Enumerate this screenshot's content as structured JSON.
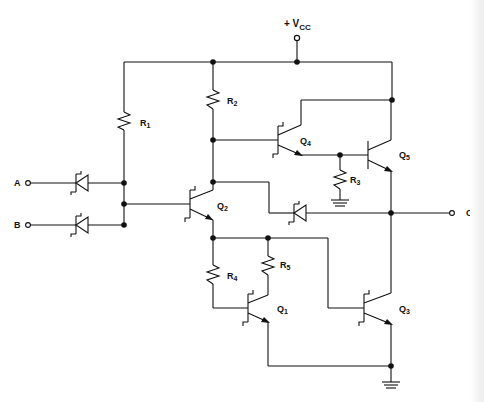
{
  "diagram": {
    "type": "circuit-schematic",
    "supply_label": "+ V",
    "supply_sub": "CC",
    "inputs": [
      {
        "label": "A"
      },
      {
        "label": "B"
      }
    ],
    "output": {
      "label": "C"
    },
    "resistors": [
      {
        "label": "R",
        "sub": "1"
      },
      {
        "label": "R",
        "sub": "2"
      },
      {
        "label": "R",
        "sub": "3"
      },
      {
        "label": "R",
        "sub": "4"
      },
      {
        "label": "R",
        "sub": "5"
      }
    ],
    "transistors": [
      {
        "label": "Q",
        "sub": "1"
      },
      {
        "label": "Q",
        "sub": "2"
      },
      {
        "label": "Q",
        "sub": "3"
      },
      {
        "label": "Q",
        "sub": "4"
      },
      {
        "label": "Q",
        "sub": "5"
      }
    ],
    "colors": {
      "ink": "#111111",
      "paper": "#ffffff"
    }
  }
}
